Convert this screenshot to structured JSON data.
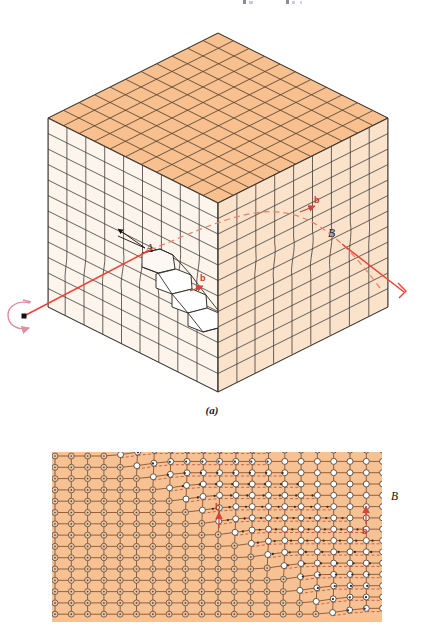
{
  "figure": {
    "domain": "Diagram",
    "title_fragment_top": "",
    "panel_a": {
      "caption": "(a)",
      "labels": {
        "A": "A",
        "B": "B",
        "C": "C",
        "burgers_front": "b",
        "burgers_right": "b"
      },
      "annotations": {
        "dislocation_line_color": "#ef4136",
        "dashed_trace_color": "#e8836a",
        "rotation_arrow_color": "#e08a9a",
        "endpoint_marker": "square-dot",
        "tail_marker": "right-angle-bracket"
      },
      "faces": {
        "top_color": "#f7c08f",
        "left_color": "#fdf4ec",
        "right_color": "#fbe2cb",
        "edge_color": "#3a3632"
      },
      "grid": {
        "top_rows": 11,
        "top_cols": 11,
        "left_rows": 12,
        "left_cols": 9,
        "right_rows": 12,
        "right_cols": 11
      }
    },
    "panel_b": {
      "caption": "",
      "labels": {
        "B": "B",
        "burgers_mid": "b",
        "burgers_right": "b"
      },
      "lattice": {
        "cols": 21,
        "rows": 15,
        "fill_color": "#f6c293",
        "bond_color": "#8a4a24",
        "normal_atom_fill": "#f6c293",
        "normal_atom_stroke": "#5b5b5b",
        "slipped_atom_fill": "#ffffff",
        "slipped_atom_stroke": "#4a4a4a",
        "dashed_color": "#c0392b"
      }
    }
  }
}
